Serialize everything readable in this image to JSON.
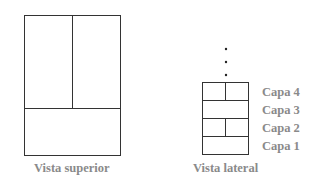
{
  "top_text_cutoff": "",
  "diagram": {
    "top_view": {
      "caption": "Vista superior",
      "regions": [
        "upper-left",
        "upper-right",
        "bottom"
      ]
    },
    "side_view": {
      "caption": "Vista lateral",
      "continuation": "⋮",
      "layers": [
        {
          "label": "Capa 4",
          "split": true
        },
        {
          "label": "Capa 3",
          "split": false
        },
        {
          "label": "Capa 2",
          "split": true
        },
        {
          "label": "Capa 1",
          "split": false
        }
      ]
    },
    "colors": {
      "line": "#333333",
      "text": "#8a8a8a"
    }
  }
}
